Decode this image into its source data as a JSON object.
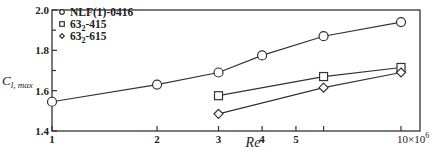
{
  "chart_data": {
    "type": "line",
    "title": "",
    "xlabel": "Re",
    "ylabel": "C_l, max",
    "ylabel_main": "C",
    "ylabel_sub": "l, max",
    "xscale": "log",
    "xlim": [
      1,
      11
    ],
    "ylim": [
      1.4,
      2.0
    ],
    "x_ticks": [
      1,
      2,
      3,
      4,
      5,
      6,
      10
    ],
    "x_tick_labels": [
      "1",
      "2",
      "3",
      "4",
      "5",
      "",
      "10×10⁶"
    ],
    "x_tick_label_last_base": "10×10",
    "x_tick_label_last_exp": "6",
    "y_ticks": [
      1.4,
      1.6,
      1.8,
      2.0
    ],
    "y_tick_labels": [
      "1.4",
      "1.6",
      "1.8",
      "2.0"
    ],
    "y_minor_ticks": [
      1.7,
      1.9
    ],
    "grid": false,
    "legend_position": "upper left",
    "series": [
      {
        "name": "NLF(1)-0416",
        "name_parts": [
          "NLF(1)-0416",
          "",
          ""
        ],
        "marker": "circle",
        "x": [
          1,
          2,
          3,
          4,
          6,
          10
        ],
        "values": [
          1.545,
          1.63,
          1.69,
          1.775,
          1.87,
          1.94
        ]
      },
      {
        "name": "63_2-415",
        "name_parts": [
          "63",
          "2",
          "-415"
        ],
        "marker": "square",
        "x": [
          3,
          6,
          10
        ],
        "values": [
          1.575,
          1.67,
          1.715
        ]
      },
      {
        "name": "63_2-615",
        "name_parts": [
          "63",
          "2",
          "-615"
        ],
        "marker": "diamond",
        "x": [
          3,
          6,
          10
        ],
        "values": [
          1.485,
          1.615,
          1.69
        ]
      }
    ]
  }
}
